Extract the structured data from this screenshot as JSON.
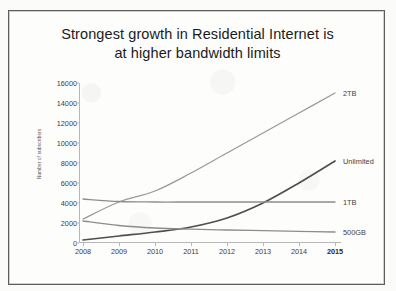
{
  "title": {
    "line1": "Strongest growth in Residential Internet is",
    "line2": "at higher bandwidth limits"
  },
  "chart_data": {
    "type": "line",
    "title": "Strongest growth in Residential Internet is at higher bandwidth limits",
    "xlabel": "",
    "ylabel": "Number of subscribers",
    "x": [
      2008,
      2009,
      2010,
      2011,
      2012,
      2013,
      2014,
      2015
    ],
    "categories": [
      "2008",
      "2009",
      "2010",
      "2011",
      "2012",
      "2013",
      "2014",
      "2015"
    ],
    "ylim": [
      0,
      16000
    ],
    "yticks": [
      0,
      2000,
      4000,
      6000,
      8000,
      10000,
      12000,
      14000,
      16000
    ],
    "grid": false,
    "legend": "line-end-labels",
    "series": [
      {
        "name": "2TB",
        "color": "#9a9a9a",
        "values": [
          2400,
          4100,
          5200,
          7000,
          9000,
          11000,
          13000,
          15000
        ]
      },
      {
        "name": "Unlimited",
        "color": "#4f4f4f",
        "values": [
          300,
          700,
          1100,
          1600,
          2500,
          4000,
          6000,
          8200
        ]
      },
      {
        "name": "1TB",
        "color": "#8d8d8d",
        "values": [
          4400,
          4150,
          4100,
          4100,
          4100,
          4100,
          4100,
          4100
        ]
      },
      {
        "name": "500GB",
        "color": "#8d8d8d",
        "values": [
          2200,
          1750,
          1500,
          1380,
          1300,
          1230,
          1160,
          1100
        ]
      }
    ]
  }
}
